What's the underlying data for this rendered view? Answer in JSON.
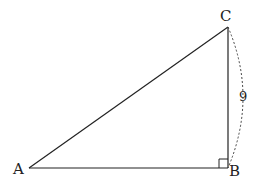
{
  "figure": {
    "type": "right-triangle",
    "vertices": {
      "A": {
        "label": "A",
        "x": 29,
        "y": 168
      },
      "B": {
        "label": "B",
        "x": 228,
        "y": 168
      },
      "C": {
        "label": "C",
        "x": 228,
        "y": 27
      }
    },
    "right_angle_at": "B",
    "measurements": [
      {
        "side": "BC",
        "label": "9",
        "style": "dashed-arc"
      }
    ],
    "colors": {
      "stroke": "#222222",
      "background": "#ffffff"
    }
  }
}
